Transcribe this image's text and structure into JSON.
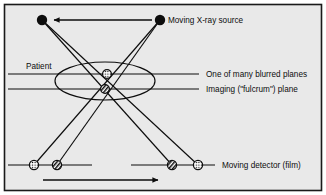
{
  "figure": {
    "background_color": "#e9e9e9",
    "frame_color": "#1a1a1a",
    "ink_color": "#0d0d0d"
  },
  "labels": {
    "source": "Moving X-ray source",
    "patient": "Patient",
    "blurred_plane": "One of many blurred planes",
    "fulcrum_plane": "Imaging (\"fulcrum\") plane",
    "detector": "Moving detector (film)"
  },
  "diagram": {
    "sources": [
      {
        "name": "source-left",
        "cx": 42,
        "cy": 20,
        "r": 5.2,
        "fill": "#0d0d0d"
      },
      {
        "name": "source-right",
        "cx": 160,
        "cy": 20,
        "r": 5.2,
        "fill": "#0d0d0d"
      }
    ],
    "source_arrow": {
      "from_x": 152,
      "to_x": 52,
      "y": 20,
      "direction": "left"
    },
    "detectors": [
      {
        "name": "detector-dotted-left",
        "cx": 34,
        "cy": 165,
        "r": 4.6,
        "pattern": "dots"
      },
      {
        "name": "detector-hatched-left",
        "cx": 57,
        "cy": 165,
        "r": 4.6,
        "pattern": "hatch"
      },
      {
        "name": "detector-hatched-right",
        "cx": 172,
        "cy": 165,
        "r": 4.6,
        "pattern": "hatch"
      },
      {
        "name": "detector-dotted-right",
        "cx": 198,
        "cy": 165,
        "r": 4.6,
        "pattern": "dots"
      }
    ],
    "detector_line_segments": [
      {
        "x1": 8,
        "x2": 92,
        "y": 165
      },
      {
        "x1": 131,
        "x2": 215,
        "y": 165
      }
    ],
    "detector_arrow": {
      "from_x": 43,
      "to_x": 160,
      "y": 180,
      "direction": "right"
    },
    "plane_lines": [
      {
        "name": "blurred-plane-line",
        "x1": 8,
        "x2": 199,
        "y": 74
      },
      {
        "name": "fulcrum-plane-line",
        "x1": 8,
        "x2": 199,
        "y": 89
      }
    ],
    "patient_ellipse": {
      "cx": 105,
      "cy": 81,
      "rx": 50,
      "ry": 19
    },
    "focus_markers": [
      {
        "name": "blurred-focus-marker",
        "cx": 107,
        "cy": 74,
        "r": 4.4,
        "pattern": "dots"
      },
      {
        "name": "fulcrum-focus-marker",
        "cx": 105,
        "cy": 89,
        "r": 4.4,
        "pattern": "hatch"
      }
    ],
    "rays": [
      {
        "name": "ray-source-left-to-dotted-detector",
        "x1": 42,
        "y1": 20,
        "x2": 198,
        "y2": 165
      },
      {
        "name": "ray-source-left-to-hatched-detector",
        "x1": 42,
        "y1": 20,
        "x2": 172,
        "y2": 165
      },
      {
        "name": "ray-source-right-to-dotted-detector",
        "x1": 160,
        "y1": 20,
        "x2": 34,
        "y2": 165
      },
      {
        "name": "ray-source-right-to-hatched-detector",
        "x1": 160,
        "y1": 20,
        "x2": 57,
        "y2": 165
      }
    ],
    "label_positions": {
      "source": {
        "x": 168,
        "y": 23
      },
      "patient": {
        "x": 26,
        "y": 69
      },
      "blurred_plane": {
        "x": 206,
        "y": 77
      },
      "fulcrum_plane": {
        "x": 206,
        "y": 92
      },
      "detector": {
        "x": 222,
        "y": 168
      }
    }
  }
}
